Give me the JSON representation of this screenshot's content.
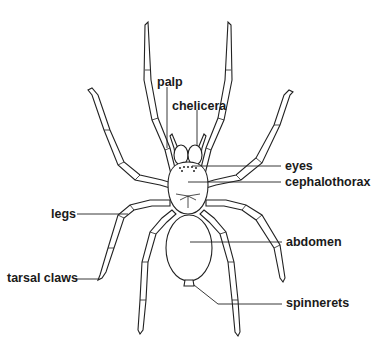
{
  "diagram": {
    "labels": [
      {
        "id": "palp",
        "text": "palp",
        "x": 157,
        "y": 76
      },
      {
        "id": "chelicera",
        "text": "chelicera",
        "x": 172,
        "y": 100
      },
      {
        "id": "eyes",
        "text": "eyes",
        "x": 285,
        "y": 160
      },
      {
        "id": "cephalothorax",
        "text": "cephalothorax",
        "x": 285,
        "y": 176
      },
      {
        "id": "legs",
        "text": "legs",
        "x": 51,
        "y": 208
      },
      {
        "id": "abdomen",
        "text": "abdomen",
        "x": 286,
        "y": 236
      },
      {
        "id": "tarsal_claws",
        "text": "tarsal claws",
        "x": 7,
        "y": 272
      },
      {
        "id": "spinnerets",
        "text": "spinnerets",
        "x": 286,
        "y": 297
      }
    ],
    "colors": {
      "line": "#222222",
      "background": "#ffffff",
      "text": "#1a1a1a"
    }
  }
}
